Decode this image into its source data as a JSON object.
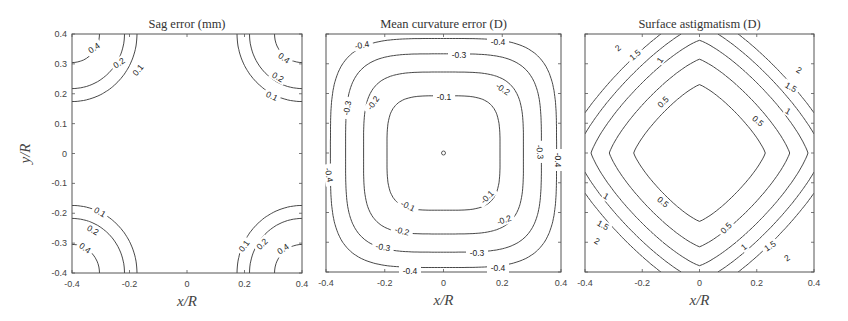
{
  "chart_data": [
    {
      "type": "contour",
      "title": "Sag error (mm)",
      "xlabel": "x/R",
      "ylabel": "y/R",
      "xlim": [
        -0.4,
        0.4
      ],
      "ylim": [
        -0.4,
        0.4
      ],
      "xticks": [
        "-0.4",
        "-0.2",
        "0",
        "0.2",
        "0.4"
      ],
      "yticks": [
        "-0.4",
        "-0.3",
        "-0.2",
        "-0.1",
        "0",
        "0.1",
        "0.2",
        "0.3",
        "0.4"
      ],
      "levels": [
        0.1,
        0.2,
        0.4
      ],
      "level_labels": [
        "0.1",
        "0.2",
        "0.4"
      ],
      "description": "Contours only in the four corners; values increase toward corners",
      "grid": false
    },
    {
      "type": "contour",
      "title": "Mean curvature error (D)",
      "xlabel": "x/R",
      "ylabel": "",
      "xlim": [
        -0.4,
        0.4
      ],
      "ylim": [
        -0.4,
        0.4
      ],
      "xticks": [
        "-0.4",
        "-0.2",
        "0",
        "0.2",
        "0.4"
      ],
      "yticks": [],
      "levels": [
        -0.4,
        -0.3,
        -0.2,
        -0.1,
        0
      ],
      "level_labels": [
        "-0.4",
        "-0.3",
        "-0.2",
        "-0.1"
      ],
      "description": "Concentric rounded-square contours around a small center marker at (0,0)",
      "grid": false
    },
    {
      "type": "contour",
      "title": "Surface astigmatism (D)",
      "xlabel": "x/R",
      "ylabel": "",
      "xlim": [
        -0.4,
        0.4
      ],
      "ylim": [
        -0.4,
        0.4
      ],
      "xticks": [
        "-0.4",
        "-0.2",
        "0",
        "0.2",
        "0.4"
      ],
      "yticks": [],
      "levels": [
        0.5,
        1,
        1.5,
        2,
        2.5
      ],
      "level_labels": [
        "0.5",
        "1",
        "1.5",
        "2"
      ],
      "description": "Diamond-shaped 0.5 contour in center; diagonal bands increasing toward corners",
      "grid": false
    }
  ],
  "panels": [
    {
      "box": [
        72,
        34,
        302,
        273
      ],
      "title": "Sag error (mm)",
      "xlabel": "x/R",
      "ylabel": "y/R"
    },
    {
      "box": [
        326,
        34,
        561,
        272
      ],
      "title": "Mean curvature error (D)",
      "xlabel": "x/R",
      "ylabel": ""
    },
    {
      "box": [
        585,
        34,
        814,
        272
      ],
      "title": "Surface astigmatism (D)",
      "xlabel": "x/R",
      "ylabel": ""
    }
  ]
}
